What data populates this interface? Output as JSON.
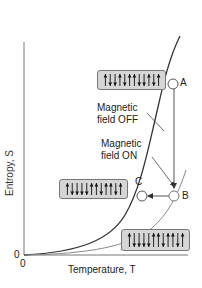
{
  "figure": {
    "y_axis_label": "Entropy, S",
    "x_axis_label": "Temperature, T",
    "y_origin": "0",
    "x_origin": "0",
    "annotations": {
      "field_off_line1": "Magnetic",
      "field_off_line2": "field OFF",
      "field_on_line1": "Magnetic",
      "field_on_line2": "field ON"
    },
    "points": [
      {
        "label": "A"
      },
      {
        "label": "B"
      },
      {
        "label": "C"
      }
    ],
    "spin_boxes": [
      {
        "name": "state-A",
        "spins": [
          "up",
          "down",
          "down",
          "up",
          "down",
          "up",
          "up",
          "down",
          "down",
          "up",
          "down",
          "up"
        ]
      },
      {
        "name": "state-C",
        "spins": [
          "up",
          "down",
          "down",
          "down",
          "down",
          "up",
          "up",
          "down",
          "up",
          "up",
          "down",
          "up"
        ]
      },
      {
        "name": "state-B",
        "spins": [
          "up",
          "down",
          "down",
          "down",
          "down",
          "up",
          "up",
          "down",
          "up",
          "up",
          "down",
          "up"
        ]
      }
    ],
    "colors": {
      "curve_off": "#333333",
      "curve_on": "#888888",
      "box_fill": "#d6d6d6",
      "axis": "#555555"
    }
  }
}
